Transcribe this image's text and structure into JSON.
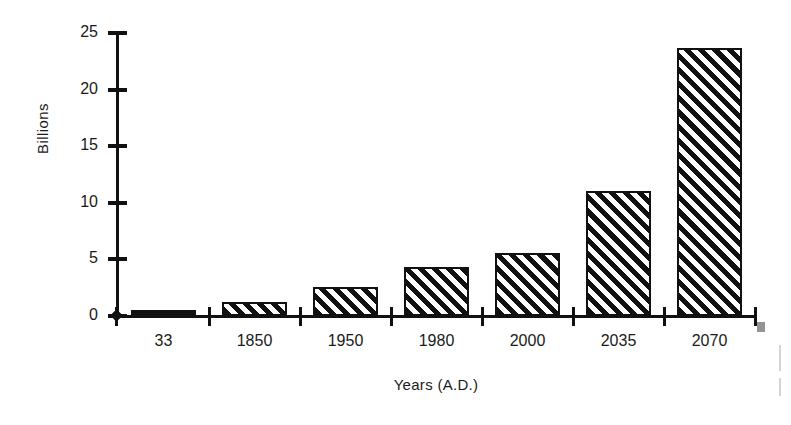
{
  "chart_data": {
    "type": "bar",
    "title": "",
    "xlabel": "Years (A.D.)",
    "ylabel": "Billions",
    "categories": [
      "33",
      "1850",
      "1950",
      "1980",
      "2000",
      "2035",
      "2070"
    ],
    "values": [
      0.25,
      1.2,
      2.6,
      4.3,
      5.6,
      11.0,
      23.7
    ],
    "ylim": [
      0,
      25
    ],
    "yticks": [
      0,
      5,
      10,
      15,
      20,
      25
    ],
    "ytick_labels": [
      "0",
      "5",
      "10",
      "15",
      "20",
      "25"
    ],
    "grid": false,
    "legend": null,
    "series": [
      {
        "name": "World population",
        "values": [
          0.25,
          1.2,
          2.6,
          4.3,
          5.6,
          11.0,
          23.7
        ]
      }
    ],
    "bar_style": "diagonal-hatch-45",
    "annotations": []
  },
  "axis": {
    "y_title": "Billions",
    "x_title": "Years (A.D.)"
  }
}
